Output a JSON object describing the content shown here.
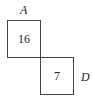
{
  "diagram": {
    "type": "two squares sharing a corner",
    "labels": {
      "top_label": "A",
      "right_label": "D"
    },
    "squares": [
      {
        "name": "upper-left-square",
        "value": "16"
      },
      {
        "name": "lower-right-square",
        "value": "7"
      }
    ],
    "colors": {
      "stroke": "#444444",
      "text": "#222222",
      "background": "#ffffff"
    }
  }
}
